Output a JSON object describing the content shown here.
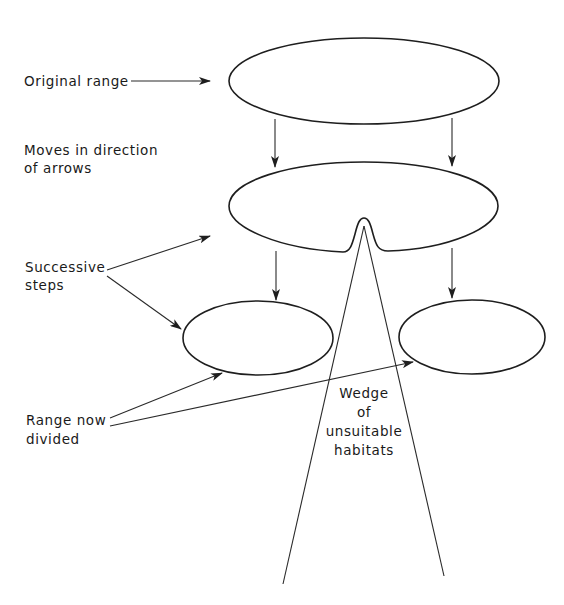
{
  "diagram": {
    "labels": {
      "original_range": "Original range",
      "moves_line1": "Moves in direction",
      "moves_line2": "of arrows",
      "successive_line1": "Successive",
      "successive_line2": "steps",
      "range_divided_line1": "Range now",
      "range_divided_line2": "divided",
      "wedge_line1": "Wedge",
      "wedge_line2": "of",
      "wedge_line3": "unsuitable",
      "wedge_line4": "habitats"
    },
    "shapes": {
      "original_range": "ellipse",
      "step_range": "ellipse with notch",
      "divided_range_left": "ellipse",
      "divided_range_right": "ellipse",
      "wedge": "triangle"
    },
    "colors": {
      "line": "#1e1e1e",
      "background": "#ffffff"
    }
  }
}
